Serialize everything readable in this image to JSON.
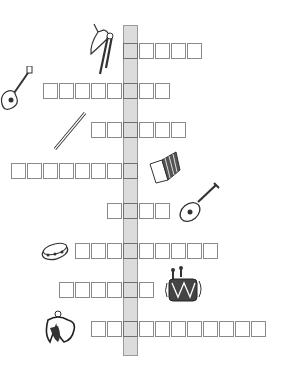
{
  "puzzle": {
    "type": "crossword",
    "theme": "musical instruments",
    "key_column_color": "#dcdcdc",
    "cell_border_color": "#8a8a8a",
    "rows": [
      {
        "clue_icon": "bagpipes",
        "length": 5,
        "key_index": 0,
        "letters": [
          "",
          "",
          "",
          "",
          ""
        ]
      },
      {
        "clue_icon": "guitar",
        "length": 8,
        "key_index": 5,
        "letters": [
          "",
          "",
          "",
          "",
          "",
          "",
          "",
          ""
        ]
      },
      {
        "clue_icon": "flute",
        "length": 6,
        "key_index": 2,
        "letters": [
          "",
          "",
          "",
          "",
          "",
          ""
        ]
      },
      {
        "clue_icon": "accordion",
        "length": 8,
        "key_index": 7,
        "letters": [
          "",
          "",
          "",
          "",
          "",
          "",
          "",
          ""
        ]
      },
      {
        "clue_icon": "mandolin",
        "length": 4,
        "key_index": 1,
        "letters": [
          "",
          "",
          "",
          ""
        ]
      },
      {
        "clue_icon": "tambourine",
        "length": 9,
        "key_index": 3,
        "letters": [
          "",
          "",
          "",
          "",
          "",
          "",
          "",
          "",
          ""
        ]
      },
      {
        "clue_icon": "drum",
        "length": 6,
        "key_index": 4,
        "letters": [
          "",
          "",
          "",
          "",
          "",
          ""
        ]
      },
      {
        "clue_icon": "castanets",
        "length": 11,
        "key_index": 2,
        "letters": [
          "",
          "",
          "",
          "",
          "",
          "",
          "",
          "",
          "",
          "",
          ""
        ]
      }
    ]
  }
}
